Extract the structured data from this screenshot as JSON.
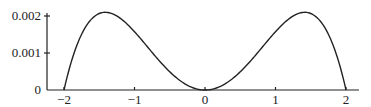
{
  "chart_data": {
    "type": "line",
    "title": "",
    "xlabel": "",
    "ylabel": "",
    "xlim": [
      -2,
      2
    ],
    "ylim": [
      0,
      0.0021
    ],
    "grid": false,
    "legend": null,
    "x_ticks": [
      -2,
      -1,
      0,
      1,
      2
    ],
    "x_tick_labels": [
      "−2",
      "−1",
      "0",
      "1",
      "2"
    ],
    "y_ticks": [
      0,
      0.001,
      0.002
    ],
    "y_tick_labels": [
      "0",
      "0.001",
      "0.002"
    ],
    "series": [
      {
        "name": "f(x)",
        "color": "#222222",
        "x": [
          -2.0,
          -1.9,
          -1.8,
          -1.7,
          -1.6,
          -1.5,
          -1.414,
          -1.3,
          -1.2,
          -1.1,
          -1.0,
          -0.9,
          -0.8,
          -0.7,
          -0.6,
          -0.5,
          -0.4,
          -0.3,
          -0.2,
          -0.1,
          0.0,
          0.1,
          0.2,
          0.3,
          0.4,
          0.5,
          0.6,
          0.7,
          0.8,
          0.9,
          1.0,
          1.1,
          1.2,
          1.3,
          1.414,
          1.5,
          1.6,
          1.7,
          1.8,
          1.9,
          2.0
        ],
        "y": [
          0.0,
          0.000738,
          0.001293,
          0.00168,
          0.001935,
          0.002067,
          0.0021,
          0.00205,
          0.001935,
          0.00176,
          0.001575,
          0.001318,
          0.001075,
          0.000849,
          0.00068,
          0.000492,
          0.000323,
          0.000185,
          8.3e-05,
          2.1e-05,
          0.0,
          2.1e-05,
          8.3e-05,
          0.000185,
          0.000323,
          0.000492,
          0.00068,
          0.000849,
          0.001075,
          0.001318,
          0.001575,
          0.00176,
          0.001935,
          0.00205,
          0.0021,
          0.002067,
          0.001935,
          0.00168,
          0.001293,
          0.000738,
          0.0
        ]
      }
    ]
  },
  "axes": {
    "color": "#222222"
  }
}
